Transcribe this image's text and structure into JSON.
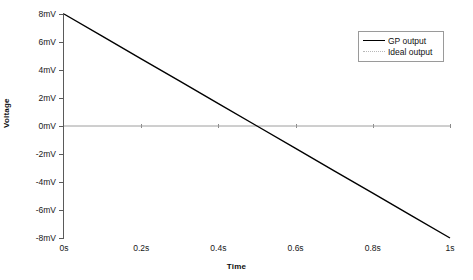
{
  "chart_data": {
    "type": "line",
    "title": "",
    "xlabel": "Time",
    "ylabel": "Voltage",
    "xlim": [
      0,
      1
    ],
    "ylim": [
      -8,
      8
    ],
    "grid": false,
    "legend_position": "top-right",
    "x_ticks": [
      {
        "value": 0,
        "label": "0s"
      },
      {
        "value": 0.2,
        "label": "0.2s"
      },
      {
        "value": 0.4,
        "label": "0.4s"
      },
      {
        "value": 0.6,
        "label": "0.6s"
      },
      {
        "value": 0.8,
        "label": "0.8s"
      },
      {
        "value": 1,
        "label": "1s"
      }
    ],
    "y_ticks": [
      {
        "value": 8,
        "label": "8mV"
      },
      {
        "value": 6,
        "label": "6mV"
      },
      {
        "value": 4,
        "label": "4mV"
      },
      {
        "value": 2,
        "label": "2mV"
      },
      {
        "value": 0,
        "label": "0mV"
      },
      {
        "value": -2,
        "label": "-2mV"
      },
      {
        "value": -4,
        "label": "-4mV"
      },
      {
        "value": -6,
        "label": "-6mV"
      },
      {
        "value": -8,
        "label": "-8mV"
      }
    ],
    "series": [
      {
        "name": "GP output",
        "style": "solid",
        "color": "#000000",
        "x": [
          0,
          0.1,
          0.2,
          0.3,
          0.4,
          0.5,
          0.6,
          0.7,
          0.8,
          0.9,
          1
        ],
        "values": [
          8,
          6.4,
          4.8,
          3.2,
          1.6,
          0,
          -1.6,
          -3.2,
          -4.8,
          -6.4,
          -8
        ]
      },
      {
        "name": "Ideal output",
        "style": "dotted",
        "color": "#9e9e9e",
        "x": [
          0,
          0.2,
          0.4,
          0.6,
          0.8,
          1
        ],
        "values": [
          0,
          0,
          0,
          0,
          0,
          0
        ]
      }
    ]
  },
  "legend": {
    "entries": [
      {
        "label": "GP output"
      },
      {
        "label": "Ideal output"
      }
    ]
  },
  "colors": {
    "gp_output": "#000000",
    "ideal_output": "#9e9e9e",
    "axis": "#5a5a5a",
    "background": "#ffffff"
  }
}
